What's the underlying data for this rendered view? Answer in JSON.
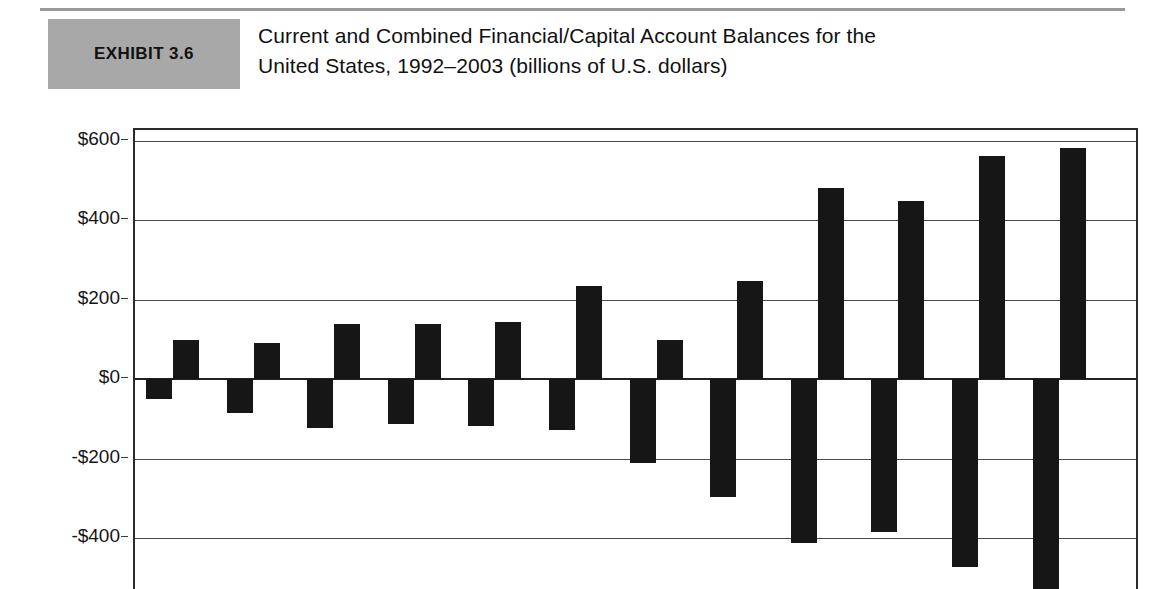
{
  "exhibit": {
    "badge_label": "EXHIBIT 3.6",
    "title_line1": "Current and Combined Financial/Capital Account Balances for the",
    "title_line2": "United States, 1992–2003 (billions of U.S. dollars)"
  },
  "colors": {
    "badge_background": "#a8a8a8",
    "bar_fill": "#161616",
    "gridline": "#4a4a4a",
    "plot_border": "#2b2b2b",
    "page_background": "#ffffff"
  },
  "chart_data": {
    "type": "bar",
    "title": "Current and Combined Financial/Capital Account Balances for the United States, 1992–2003 (billions of U.S. dollars)",
    "xlabel": "",
    "ylabel": "",
    "ylim": [
      -600,
      600
    ],
    "yticks": [
      600,
      400,
      200,
      0,
      -200,
      -400
    ],
    "ytick_labels": [
      "$600",
      "$400",
      "$200",
      "$0",
      "-$200",
      "-$400"
    ],
    "grid": true,
    "legend": "none",
    "x_axis_visible": false,
    "note": "Bottom of plot is cropped; the two right-most negative bars extend past the visible image edge.",
    "categories": [
      "1992",
      "1993",
      "1994",
      "1995",
      "1996",
      "1997",
      "1998",
      "1999",
      "2000",
      "2001",
      "2002",
      "2003"
    ],
    "series": [
      {
        "name": "Current account balance",
        "values": [
          -50,
          -85,
          -122,
          -112,
          -118,
          -128,
          -210,
          -297,
          -413,
          -386,
          -474,
          -531
        ]
      },
      {
        "name": "Combined financial/capital account balance",
        "values": [
          98,
          92,
          138,
          140,
          145,
          235,
          100,
          248,
          482,
          450,
          562,
          582
        ]
      }
    ]
  }
}
